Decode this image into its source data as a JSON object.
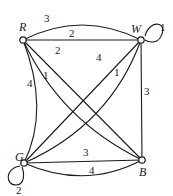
{
  "graph": {
    "nodes": [
      {
        "id": "R",
        "label": "R"
      },
      {
        "id": "W",
        "label": "W"
      },
      {
        "id": "G",
        "label": "G"
      },
      {
        "id": "B",
        "label": "B"
      }
    ],
    "edges": [
      {
        "from": "R",
        "to": "W",
        "weight": "3",
        "style": "curved"
      },
      {
        "from": "R",
        "to": "W",
        "weight": "2",
        "style": "straight"
      },
      {
        "from": "W",
        "to": "W",
        "weight": "1",
        "style": "loop"
      },
      {
        "from": "R",
        "to": "B",
        "weight": "2",
        "style": "straight"
      },
      {
        "from": "R",
        "to": "B",
        "weight": "1",
        "style": "curved"
      },
      {
        "from": "R",
        "to": "G",
        "weight": "4",
        "style": "curved"
      },
      {
        "from": "W",
        "to": "G",
        "weight": "4",
        "style": "straight"
      },
      {
        "from": "W",
        "to": "G",
        "weight": "1",
        "style": "curved"
      },
      {
        "from": "W",
        "to": "B",
        "weight": "3",
        "style": "straight"
      },
      {
        "from": "G",
        "to": "B",
        "weight": "3",
        "style": "straight"
      },
      {
        "from": "G",
        "to": "B",
        "weight": "4",
        "style": "curved"
      },
      {
        "from": "G",
        "to": "G",
        "weight": "2",
        "style": "loop"
      }
    ]
  }
}
